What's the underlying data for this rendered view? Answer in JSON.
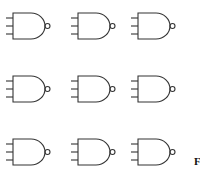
{
  "diagram": {
    "type": "logic-gate-grid",
    "gate_type": "NAND",
    "inputs_per_gate": 3,
    "rows": 3,
    "columns": 3,
    "stroke_color": "#333333",
    "gates": [
      {
        "row": 1,
        "col": 1,
        "x": 13,
        "y": 13
      },
      {
        "row": 1,
        "col": 2,
        "x": 78,
        "y": 13
      },
      {
        "row": 1,
        "col": 3,
        "x": 138,
        "y": 13
      },
      {
        "row": 2,
        "col": 1,
        "x": 13,
        "y": 76
      },
      {
        "row": 2,
        "col": 2,
        "x": 78,
        "y": 76
      },
      {
        "row": 2,
        "col": 3,
        "x": 138,
        "y": 76
      },
      {
        "row": 3,
        "col": 1,
        "x": 13,
        "y": 139
      },
      {
        "row": 3,
        "col": 2,
        "x": 78,
        "y": 139
      },
      {
        "row": 3,
        "col": 3,
        "x": 138,
        "y": 139
      }
    ]
  },
  "caption": {
    "text": "F"
  }
}
